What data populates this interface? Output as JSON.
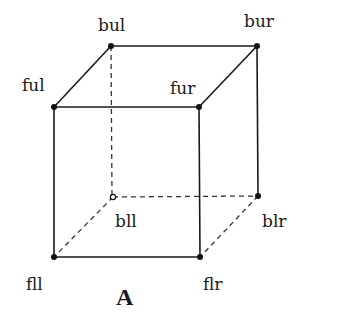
{
  "diagram": {
    "caption": "A",
    "vertices": {
      "ful": {
        "label": "ful",
        "x": 54,
        "y": 107
      },
      "bul": {
        "label": "bul",
        "x": 111,
        "y": 46
      },
      "bur": {
        "label": "bur",
        "x": 257,
        "y": 46
      },
      "fur": {
        "label": "fur",
        "x": 199,
        "y": 107
      },
      "fll": {
        "label": "fll",
        "x": 54,
        "y": 257
      },
      "flr": {
        "label": "flr",
        "x": 200,
        "y": 257
      },
      "bll": {
        "label": "bll",
        "x": 113,
        "y": 197
      },
      "blr": {
        "label": "blr",
        "x": 258,
        "y": 196
      }
    },
    "solid_edges": [
      [
        "ful",
        "bul"
      ],
      [
        "bul",
        "bur"
      ],
      [
        "bur",
        "fur"
      ],
      [
        "fur",
        "ful"
      ],
      [
        "ful",
        "fll"
      ],
      [
        "fur",
        "flr"
      ],
      [
        "bur",
        "blr"
      ],
      [
        "fll",
        "flr"
      ]
    ],
    "dashed_edges": [
      [
        "bul",
        "bll"
      ],
      [
        "bll",
        "blr"
      ],
      [
        "bll",
        "fll"
      ],
      [
        "blr",
        "flr"
      ]
    ],
    "hidden_vertex": "bll"
  }
}
